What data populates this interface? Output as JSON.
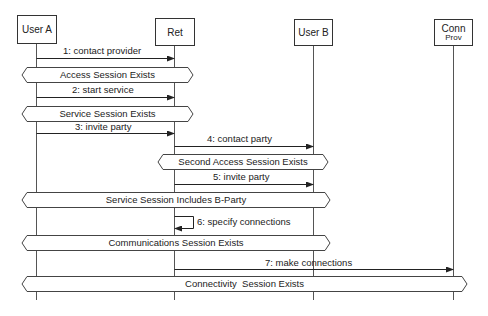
{
  "diagram": {
    "type": "sequence",
    "participants": [
      {
        "id": "user_a",
        "label": "User A",
        "sub": ""
      },
      {
        "id": "ret",
        "label": "Ret",
        "sub": ""
      },
      {
        "id": "user_b",
        "label": "User B",
        "sub": ""
      },
      {
        "id": "conn_prov",
        "label": "Conn",
        "sub": "Prov"
      }
    ],
    "messages": [
      {
        "label": "1: contact provider",
        "from": "user_a",
        "to": "ret"
      },
      {
        "label": "2: start service",
        "from": "user_a",
        "to": "ret"
      },
      {
        "label": "3: invite party",
        "from": "user_a",
        "to": "ret"
      },
      {
        "label": "4: contact party",
        "from": "ret",
        "to": "user_b"
      },
      {
        "label": "5: invite party",
        "from": "ret",
        "to": "user_b"
      },
      {
        "label": "6: specify connections",
        "from": "ret",
        "to": "ret"
      },
      {
        "label": "7: make connections",
        "from": "ret",
        "to": "conn_prov"
      }
    ],
    "sessions": [
      {
        "label": "Access Session Exists"
      },
      {
        "label": "Service Session Exists"
      },
      {
        "label": "Second Access Session Exists"
      },
      {
        "label": "Service Session Includes B-Party"
      },
      {
        "label": "Communications Session Exists"
      },
      {
        "label": "Connectivity  Session Exists"
      }
    ]
  }
}
